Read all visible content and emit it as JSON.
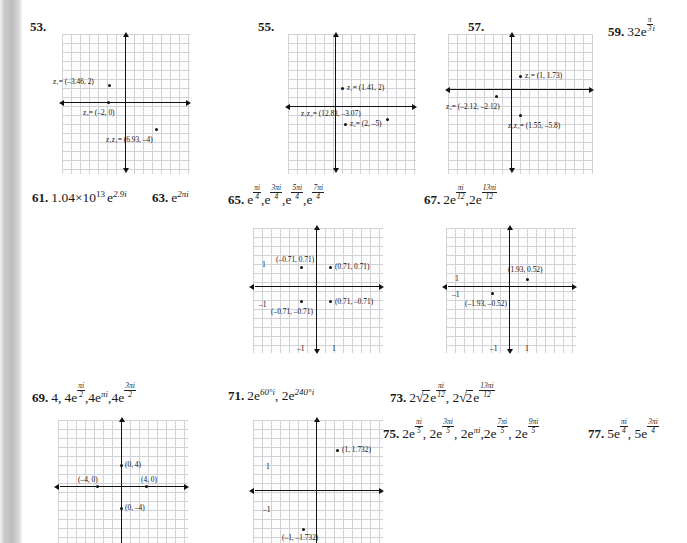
{
  "page": {
    "background": "#ffffff",
    "gutter_color": "#c2c2c2",
    "text_color": "#1a1a1a"
  },
  "problems": {
    "p53": {
      "num": "53."
    },
    "p55": {
      "num": "55."
    },
    "p57": {
      "num": "57."
    },
    "p59": {
      "num": "59.",
      "base": "32e",
      "exp_num": "π",
      "exp_den": "3",
      "exp_tail": "i"
    },
    "p61": {
      "num": "61.",
      "expr": "1.04×10",
      "exp1": "13",
      "e": "e",
      "exp2": "2.9i"
    },
    "p63": {
      "num": "63.",
      "e": "e",
      "exp": "2πi"
    },
    "p65": {
      "num": "65.",
      "terms": [
        {
          "base": "e",
          "nu": "πi",
          "de": "4"
        },
        {
          "base": "e",
          "nu": "3πi",
          "de": "4"
        },
        {
          "base": "e",
          "nu": "5πi",
          "de": "4"
        },
        {
          "base": "e",
          "nu": "7πi",
          "de": "4"
        }
      ]
    },
    "p67": {
      "num": "67.",
      "terms": [
        {
          "base": "2e",
          "nu": "πi",
          "de": "12"
        },
        {
          "base": "2e",
          "nu": "13πi",
          "de": "12"
        }
      ]
    },
    "p69": {
      "num": "69.",
      "first": "4,",
      "terms": [
        {
          "base": "4e",
          "nu": "πi",
          "de": "2"
        },
        {
          "base": "4e",
          "sup": "πi"
        },
        {
          "base": "4e",
          "nu": "3πi",
          "de": "2"
        }
      ]
    },
    "p71": {
      "num": "71.",
      "terms": [
        {
          "base": "2e",
          "sup": "60°i"
        },
        {
          "base": "2e",
          "sup": "240°i"
        }
      ]
    },
    "p73": {
      "num": "73.",
      "terms": [
        {
          "coef": "2",
          "radical": "√",
          "radicand": "2",
          "base": "e",
          "nu": "πi",
          "de": "12"
        },
        {
          "coef": "2",
          "radical": "√",
          "radicand": "2",
          "base": "e",
          "nu": "13πi",
          "de": "12"
        }
      ]
    },
    "p75": {
      "num": "75.",
      "terms": [
        {
          "base": "2e",
          "nu": "πi",
          "de": "5"
        },
        {
          "base": "2e",
          "nu": "3πi",
          "de": "5"
        },
        {
          "base": "2e",
          "sup": "πi"
        },
        {
          "base": "2e",
          "nu": "7πi",
          "de": "5"
        },
        {
          "base": "2e",
          "nu": "9πi",
          "de": "5"
        }
      ]
    },
    "p77": {
      "num": "77.",
      "terms": [
        {
          "base": "5e",
          "nu": "πi",
          "de": "4"
        },
        {
          "base": "5e",
          "nu": "3πi",
          "de": "4"
        }
      ]
    }
  },
  "graphs": [
    {
      "id": "graph-53",
      "for_problem": "53",
      "points": [
        {
          "label": "z₁= (–3.46, 2)",
          "var": "z",
          "sub": "1",
          "coords": "(–3.46, 2)"
        },
        {
          "label": "z₂= (–2, 0)",
          "var": "z",
          "sub": "2",
          "coords": "(–2, 0)"
        },
        {
          "label": "z₁z₂= (6.93, –4)",
          "var": "z1z2",
          "coords": "(6.93, –4)"
        }
      ],
      "ticks": []
    },
    {
      "id": "graph-55",
      "for_problem": "55",
      "points": [
        {
          "label": "z₁= (1.41, 2)",
          "var": "z",
          "sub": "1",
          "coords": "(1.41, 2)"
        },
        {
          "label": "z₁z₂= (12.83, –3.07)",
          "var": "z1z2",
          "coords": "(12.83, –3.07)"
        },
        {
          "label": "z₂= (2, –5)",
          "var": "z",
          "sub": "2",
          "coords": "(2, –5)"
        }
      ],
      "ticks": []
    },
    {
      "id": "graph-57",
      "for_problem": "57",
      "points": [
        {
          "label": "z₁= (1, 1.73)",
          "var": "z",
          "sub": "1",
          "coords": "(1, 1.73)"
        },
        {
          "label": "z₂= (–2.12, –2.12)",
          "var": "z",
          "sub": "2",
          "coords": "(–2.12, –2.12)"
        },
        {
          "label": "z₁z₂= (1.55, –5.8)",
          "var": "z1z2",
          "coords": "(1.55, –5.8)"
        }
      ],
      "ticks": []
    },
    {
      "id": "graph-65",
      "for_problem": "65",
      "points": [
        {
          "label": "(–0.71, 0.71)"
        },
        {
          "label": "(0.71, 0.71)"
        },
        {
          "label": "(–0.71, –0.71)"
        },
        {
          "label": "(0.71, –0.71)"
        }
      ],
      "ticks": [
        "1",
        "–1",
        "–1",
        "1"
      ]
    },
    {
      "id": "graph-67",
      "for_problem": "67",
      "points": [
        {
          "label": "(1.93, 0.52)"
        },
        {
          "label": "(–1.93, –0.52)"
        }
      ],
      "ticks": [
        "1",
        "–1",
        "–1",
        "1"
      ]
    },
    {
      "id": "graph-69",
      "for_problem": "69",
      "points": [
        {
          "label": "(0, 4)"
        },
        {
          "label": "(–4, 0)"
        },
        {
          "label": "(4, 0)"
        },
        {
          "label": "(0, –4)"
        }
      ],
      "ticks": []
    },
    {
      "id": "graph-71",
      "for_problem": "71",
      "points": [
        {
          "label": "(1, 1.732)"
        },
        {
          "label": "(–1, –1.732)"
        }
      ],
      "ticks": [
        "1",
        "–1"
      ]
    }
  ]
}
